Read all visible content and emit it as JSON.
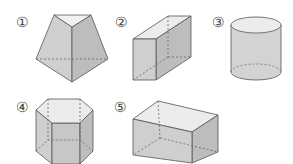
{
  "figure": {
    "colors": {
      "face_light": "#e6e6e6",
      "face_mid": "#cfcfcf",
      "face_dark": "#bdbdbd",
      "edge": "#555555",
      "hidden_edge": "#666666"
    },
    "shapes": [
      {
        "label": "①",
        "name": "triangular-frustum-like prism"
      },
      {
        "label": "②",
        "name": "rectangular prism (tall)"
      },
      {
        "label": "③",
        "name": "cylinder"
      },
      {
        "label": "④",
        "name": "hexagonal prism"
      },
      {
        "label": "⑤",
        "name": "rectangular prism (wide)"
      }
    ]
  }
}
